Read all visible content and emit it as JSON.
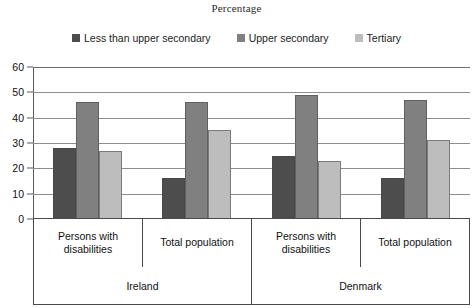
{
  "chart_data": {
    "type": "bar",
    "title": "Percentage",
    "xlabel": "",
    "ylabel": "",
    "ylim": [
      0,
      60
    ],
    "yticks": [
      0,
      10,
      20,
      30,
      40,
      50,
      60
    ],
    "grid": true,
    "legend_position": "top-center",
    "categories": [
      "Persons with disabilities",
      "Total population",
      "Persons with disabilities",
      "Total population"
    ],
    "group_labels": [
      "Ireland",
      "Denmark"
    ],
    "series": [
      {
        "name": "Less than upper secondary",
        "color": "#4d4d4d",
        "values": [
          28,
          16,
          25,
          16
        ]
      },
      {
        "name": "Upper secondary",
        "color": "#808080",
        "values": [
          46,
          46,
          49,
          47
        ]
      },
      {
        "name": "Tertiary",
        "color": "#bdbdbd",
        "values": [
          27,
          35,
          23,
          31
        ]
      }
    ]
  },
  "axis": {
    "tick_labels": [
      "60",
      "50",
      "40",
      "30",
      "20",
      "10",
      "0"
    ]
  },
  "colors": {
    "axis": "#4a4a4a",
    "grid": "#8d8d8d",
    "text": "#111111",
    "background": "#ffffff"
  }
}
